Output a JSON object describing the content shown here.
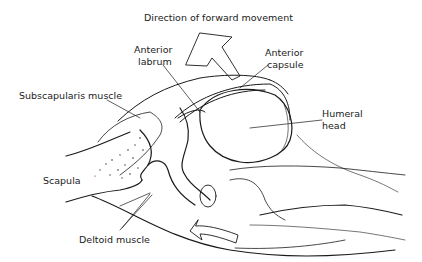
{
  "diagram": {
    "title": "Direction of forward movement",
    "labels": {
      "direction": "Direction of forward movement",
      "anterior_labrum_1": "Anterior",
      "anterior_labrum_2": "labrum",
      "anterior_capsule_1": "Anterior",
      "anterior_capsule_2": "capsule",
      "subscapularis": "Subscapularis muscle",
      "humeral_head_1": "Humeral",
      "humeral_head_2": "head",
      "scapula": "Scapula",
      "deltoid": "Deltoid muscle"
    },
    "colors": {
      "line": "#1a1a1a",
      "background": "#ffffff"
    }
  }
}
